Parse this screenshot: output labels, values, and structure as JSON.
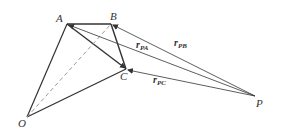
{
  "diagram": {
    "points": {
      "A": {
        "label": "A",
        "x": 67,
        "y": 24
      },
      "B": {
        "label": "B",
        "x": 111,
        "y": 24
      },
      "C": {
        "label": "C",
        "x": 126,
        "y": 69
      },
      "O": {
        "label": "O",
        "x": 27,
        "y": 117
      },
      "P": {
        "label": "P",
        "x": 255,
        "y": 96
      }
    },
    "vectors": {
      "r_PA": {
        "main": "r",
        "sub": "PA"
      },
      "r_PB": {
        "main": "r",
        "sub": "PB"
      },
      "r_PC": {
        "main": "r",
        "sub": "PC"
      }
    },
    "colors": {
      "line": "#333333",
      "dashed": "#999999"
    }
  }
}
